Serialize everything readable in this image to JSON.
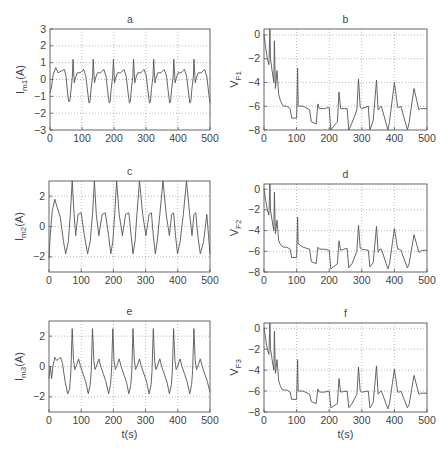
{
  "figure": {
    "xlabel_bottom": "t(s)"
  },
  "chart_data": [
    {
      "id": "a",
      "type": "line",
      "title": "a",
      "ylabel_main": "I",
      "ylabel_sub": "m1",
      "ylabel_unit": "(A)",
      "xlabel": "",
      "xlim": [
        0,
        500
      ],
      "ylim": [
        -3,
        3
      ],
      "xticks": [
        0,
        100,
        200,
        300,
        400,
        500
      ],
      "yticks": [
        -3,
        -2,
        -1,
        0,
        1,
        2,
        3
      ],
      "grid": true,
      "box": {
        "x": 50,
        "y": 29,
        "w": 160,
        "h": 101
      },
      "period": 63,
      "x": [
        0,
        4,
        10,
        18,
        25,
        35,
        45,
        50,
        55,
        58,
        62,
        66,
        70,
        72,
        74,
        76,
        78,
        85,
        95,
        105,
        112,
        118,
        122,
        125,
        128,
        133,
        135,
        137,
        139,
        141,
        148,
        158,
        168,
        175,
        181,
        185,
        188,
        191,
        196,
        198,
        200,
        202,
        204,
        211,
        221,
        231,
        238,
        244,
        248,
        251,
        254,
        259,
        261,
        263,
        265,
        267,
        274,
        284,
        294,
        301,
        307,
        311,
        314,
        317,
        322,
        324,
        326,
        328,
        330,
        337,
        347,
        357,
        364,
        370,
        374,
        377,
        380,
        385,
        387,
        389,
        391,
        393,
        400,
        410,
        420,
        427,
        433,
        437,
        440,
        443,
        448,
        450,
        452,
        454,
        456,
        463,
        473,
        483,
        490,
        496,
        500
      ],
      "values": [
        -0.8,
        -0.5,
        0.3,
        0.7,
        0.4,
        0.5,
        0.6,
        0.2,
        -0.8,
        -1.3,
        -1.3,
        -0.6,
        0.2,
        1.2,
        0.5,
        -0.2,
        0.0,
        0.4,
        0.4,
        0.6,
        0.2,
        -0.8,
        -1.4,
        -1.3,
        -0.6,
        0.2,
        1.2,
        0.5,
        -0.2,
        0.0,
        0.4,
        0.4,
        0.6,
        0.2,
        -0.8,
        -1.4,
        -1.3,
        -0.6,
        0.2,
        1.2,
        0.5,
        -0.2,
        0.0,
        0.4,
        0.4,
        0.6,
        0.2,
        -0.8,
        -1.4,
        -1.3,
        -0.6,
        0.2,
        1.2,
        0.5,
        -0.2,
        0.0,
        0.4,
        0.4,
        0.6,
        0.2,
        -0.8,
        -1.4,
        -1.3,
        -0.6,
        0.2,
        1.2,
        0.5,
        -0.2,
        0.0,
        0.4,
        0.4,
        0.6,
        0.2,
        -0.8,
        -1.4,
        -1.3,
        -0.6,
        0.2,
        1.2,
        0.5,
        -0.2,
        0.0,
        0.4,
        0.4,
        0.6,
        0.2,
        -0.8,
        -1.4,
        -1.3,
        -0.6,
        0.2,
        1.2,
        0.5,
        -0.2,
        0.0,
        0.4,
        0.4,
        0.6,
        0.2,
        -0.8,
        -1.4
      ]
    },
    {
      "id": "b",
      "type": "line",
      "title": "b",
      "ylabel_main": "V",
      "ylabel_sub": "F1",
      "ylabel_unit": "",
      "xlabel": "",
      "xlim": [
        0,
        500
      ],
      "ylim": [
        -8,
        0.5
      ],
      "xticks": [
        0,
        100,
        200,
        300,
        400,
        500
      ],
      "yticks": [
        -8,
        -6,
        -4,
        -2,
        0
      ],
      "grid": true,
      "box": {
        "x": 264,
        "y": 29,
        "w": 163,
        "h": 101
      },
      "x": [
        0,
        5,
        10,
        15,
        18,
        20,
        25,
        30,
        32,
        35,
        40,
        45,
        50,
        55,
        60,
        70,
        80,
        85,
        100,
        103,
        105,
        107,
        110,
        120,
        140,
        145,
        160,
        165,
        170,
        185,
        200,
        205,
        225,
        230,
        235,
        255,
        260,
        270,
        285,
        290,
        295,
        300,
        320,
        325,
        335,
        345,
        350,
        355,
        360,
        380,
        385,
        400,
        410,
        415,
        420,
        440,
        445,
        460,
        475,
        480,
        485,
        500
      ],
      "values": [
        0,
        -1,
        -2,
        -2.5,
        0.5,
        -2,
        -3,
        -4,
        -0.5,
        -4.5,
        -3,
        -5,
        -5.5,
        -5.8,
        -6,
        -6,
        -6.2,
        -7,
        -7,
        -2.8,
        -6,
        -6,
        -6,
        -6,
        -6.3,
        -7.3,
        -7.5,
        -5.8,
        -6.2,
        -6.2,
        -6.1,
        -8,
        -7.3,
        -4.8,
        -6.2,
        -6.2,
        -8,
        -7.4,
        -6.3,
        -3.7,
        -6.1,
        -6.2,
        -6,
        -8,
        -7.2,
        -3.8,
        -6.3,
        -6.1,
        -6,
        -8,
        -7.3,
        -4.0,
        -6.1,
        -6.1,
        -6,
        -8,
        -7.4,
        -4.5,
        -6.3,
        -6.2,
        -6.2,
        -6.2
      ]
    },
    {
      "id": "c",
      "type": "line",
      "title": "c",
      "ylabel_main": "I",
      "ylabel_sub": "m2",
      "ylabel_unit": "(A)",
      "xlabel": "",
      "xlim": [
        0,
        500
      ],
      "ylim": [
        -3,
        3
      ],
      "xticks": [
        0,
        100,
        200,
        300,
        400,
        500
      ],
      "yticks": [
        -2,
        0,
        2
      ],
      "grid": true,
      "box": {
        "x": 49,
        "y": 181,
        "w": 161,
        "h": 91
      },
      "x": [
        0,
        4,
        10,
        18,
        25,
        35,
        45,
        52,
        60,
        66,
        72,
        78,
        83,
        90,
        100,
        110,
        120,
        128,
        135,
        141,
        147,
        155,
        165,
        175,
        185,
        192,
        198,
        204,
        210,
        218,
        228,
        238,
        248,
        255,
        261,
        267,
        273,
        281,
        291,
        301,
        311,
        318,
        324,
        330,
        336,
        344,
        354,
        364,
        374,
        381,
        387,
        393,
        399,
        407,
        417,
        427,
        437,
        444,
        450,
        456,
        462,
        470,
        480,
        490,
        500
      ],
      "values": [
        -2.1,
        -0.5,
        1.0,
        1.8,
        1.3,
        0.6,
        -1.0,
        -1.8,
        -1.0,
        0.8,
        3.0,
        0.8,
        -0.6,
        0.8,
        0.9,
        -0.6,
        -1.8,
        -1.0,
        0.8,
        3.0,
        0.8,
        -0.6,
        0.8,
        0.9,
        -0.6,
        -1.8,
        -1.0,
        0.8,
        3.0,
        0.8,
        -0.6,
        0.8,
        0.9,
        -0.6,
        -1.8,
        -1.0,
        0.8,
        3.0,
        0.8,
        -0.6,
        0.8,
        0.9,
        -0.6,
        -1.8,
        -1.0,
        0.8,
        3.0,
        0.8,
        -0.6,
        0.8,
        0.9,
        -0.6,
        -1.8,
        -1.0,
        0.8,
        3.0,
        0.8,
        -0.6,
        0.8,
        0.9,
        -0.6,
        -1.8,
        -1.0,
        0.8,
        -1.8
      ]
    },
    {
      "id": "d",
      "type": "line",
      "title": "d",
      "ylabel_main": "V",
      "ylabel_sub": "F2",
      "ylabel_unit": "",
      "xlabel": "",
      "xlim": [
        0,
        500
      ],
      "ylim": [
        -8,
        0.5
      ],
      "xticks": [
        0,
        100,
        200,
        300,
        400,
        500
      ],
      "yticks": [
        -8,
        -6,
        -4,
        -2,
        0
      ],
      "grid": true,
      "box": {
        "x": 264,
        "y": 184,
        "w": 163,
        "h": 88
      },
      "x": [
        0,
        5,
        10,
        15,
        18,
        20,
        25,
        30,
        32,
        35,
        40,
        45,
        50,
        55,
        60,
        70,
        80,
        85,
        100,
        103,
        105,
        107,
        110,
        120,
        140,
        145,
        160,
        165,
        170,
        185,
        200,
        205,
        225,
        230,
        235,
        255,
        260,
        270,
        285,
        290,
        295,
        300,
        320,
        325,
        335,
        345,
        350,
        355,
        360,
        380,
        385,
        400,
        410,
        415,
        420,
        440,
        445,
        460,
        475,
        480,
        485,
        500
      ],
      "values": [
        0,
        -1,
        -2,
        -2.5,
        0.5,
        -2,
        -3,
        -4,
        -0.3,
        -4.3,
        -3,
        -5,
        -5.3,
        -5.5,
        -5.6,
        -5.6,
        -5.8,
        -6.6,
        -6.6,
        -2.7,
        -5.3,
        -5.3,
        -5.4,
        -5.6,
        -5.8,
        -7,
        -7.2,
        -5.6,
        -5.8,
        -5.8,
        -5.9,
        -7.7,
        -7.2,
        -5.0,
        -5.9,
        -5.7,
        -7.6,
        -7.2,
        -6.0,
        -3.5,
        -5.7,
        -5.8,
        -5.9,
        -7.5,
        -7.1,
        -3.6,
        -6.1,
        -5.8,
        -5.8,
        -7.7,
        -7.2,
        -3.8,
        -5.8,
        -5.8,
        -5.9,
        -7.6,
        -7.2,
        -4.4,
        -6.1,
        -6.0,
        -5.9,
        -5.9
      ]
    },
    {
      "id": "e",
      "type": "line",
      "title": "e",
      "ylabel_main": "I",
      "ylabel_sub": "m3",
      "ylabel_unit": "(A)",
      "xlabel": "t(s)",
      "xlim": [
        0,
        500
      ],
      "ylim": [
        -3,
        3
      ],
      "xticks": [
        0,
        100,
        200,
        300,
        400,
        500
      ],
      "yticks": [
        -2,
        0,
        2
      ],
      "grid": true,
      "box": {
        "x": 49,
        "y": 321,
        "w": 161,
        "h": 91
      },
      "x": [
        0,
        4,
        8,
        12,
        18,
        24,
        30,
        36,
        42,
        50,
        58,
        64,
        68,
        72,
        76,
        80,
        84,
        92,
        98,
        106,
        114,
        122,
        128,
        131,
        135,
        139,
        143,
        147,
        155,
        161,
        169,
        177,
        185,
        191,
        194,
        198,
        202,
        206,
        210,
        218,
        224,
        232,
        240,
        248,
        254,
        257,
        261,
        265,
        269,
        273,
        281,
        287,
        295,
        303,
        311,
        317,
        320,
        324,
        328,
        332,
        336,
        344,
        350,
        358,
        366,
        374,
        380,
        383,
        387,
        391,
        395,
        399,
        407,
        413,
        421,
        429,
        437,
        443,
        446,
        450,
        454,
        458,
        462,
        470,
        476,
        484,
        492,
        500
      ],
      "values": [
        -0.8,
        0.0,
        -0.8,
        0.0,
        0.6,
        0.4,
        0.5,
        0.6,
        0.2,
        -1.0,
        -1.8,
        -1.5,
        -0.3,
        2.5,
        0.4,
        -0.2,
        0.0,
        0.5,
        0.0,
        -0.5,
        -1.0,
        -1.8,
        -1.2,
        -0.3,
        2.5,
        0.4,
        -0.2,
        0.0,
        0.5,
        0.0,
        -0.5,
        -1.0,
        -1.8,
        -1.2,
        -0.3,
        2.5,
        0.4,
        -0.2,
        0.0,
        0.5,
        0.0,
        -0.5,
        -1.0,
        -1.8,
        -1.2,
        -0.3,
        2.5,
        0.4,
        -0.2,
        0.0,
        0.5,
        0.0,
        -0.5,
        -1.0,
        -1.8,
        -1.2,
        -0.3,
        2.5,
        0.4,
        -0.2,
        0.0,
        0.5,
        0.0,
        -0.5,
        -1.0,
        -1.8,
        -1.2,
        -0.3,
        2.5,
        0.4,
        -0.2,
        0.0,
        0.5,
        0.0,
        -0.5,
        -1.0,
        -1.8,
        -1.2,
        -0.3,
        2.5,
        0.4,
        -0.2,
        0.0,
        0.5,
        0.0,
        -0.5,
        -1.0,
        -1.7
      ]
    },
    {
      "id": "f",
      "type": "line",
      "title": "f",
      "ylabel_main": "V",
      "ylabel_sub": "F3",
      "ylabel_unit": "",
      "xlabel": "t(s)",
      "xlim": [
        0,
        500
      ],
      "ylim": [
        -8,
        0.5
      ],
      "xticks": [
        0,
        100,
        200,
        300,
        400,
        500
      ],
      "yticks": [
        -8,
        -6,
        -4,
        -2,
        0
      ],
      "grid": true,
      "box": {
        "x": 264,
        "y": 323,
        "w": 163,
        "h": 89
      },
      "x": [
        0,
        5,
        10,
        15,
        18,
        20,
        25,
        30,
        32,
        35,
        40,
        45,
        50,
        55,
        60,
        70,
        80,
        85,
        100,
        103,
        105,
        107,
        110,
        120,
        140,
        145,
        160,
        165,
        170,
        185,
        200,
        205,
        225,
        230,
        235,
        255,
        260,
        270,
        285,
        290,
        295,
        300,
        320,
        325,
        335,
        345,
        350,
        355,
        360,
        380,
        385,
        400,
        410,
        415,
        420,
        440,
        445,
        460,
        475,
        480,
        485,
        500
      ],
      "values": [
        0,
        -1,
        -2,
        -2.5,
        0.5,
        -2,
        -3,
        -4,
        -0.3,
        -4.3,
        -3,
        -5,
        -5.5,
        -5.8,
        -5.9,
        -5.9,
        -6.1,
        -6.8,
        -6.8,
        -3.0,
        -6.0,
        -6.0,
        -6.0,
        -6.0,
        -6.3,
        -7.0,
        -7.2,
        -5.8,
        -6.1,
        -6.1,
        -6.0,
        -7.6,
        -7.2,
        -4.8,
        -6.1,
        -6.0,
        -7.6,
        -7.2,
        -6.3,
        -3.7,
        -6.0,
        -6.1,
        -6.0,
        -7.6,
        -7.1,
        -3.6,
        -6.3,
        -6.1,
        -6.0,
        -7.7,
        -7.2,
        -3.9,
        -6.1,
        -6.1,
        -6.0,
        -7.6,
        -7.3,
        -4.5,
        -6.3,
        -6.2,
        -6.2,
        -6.2
      ]
    }
  ]
}
